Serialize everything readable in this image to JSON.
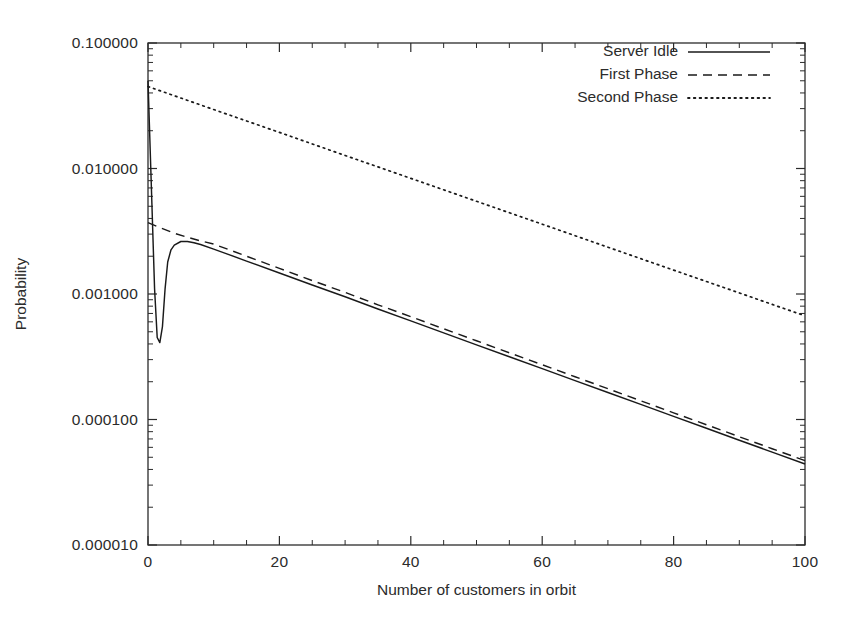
{
  "chart_data": {
    "type": "line",
    "title": "",
    "xlabel": "Number of customers in orbit",
    "ylabel": "Probability",
    "xlim": [
      0,
      100
    ],
    "ylim": [
      1e-05,
      0.1
    ],
    "yscale": "log",
    "xscale": "linear",
    "grid": false,
    "legend_position": "top-right inside plot",
    "xticks": [
      0,
      20,
      40,
      60,
      80,
      100
    ],
    "xtick_labels": [
      "0",
      "20",
      "40",
      "60",
      "80",
      "100"
    ],
    "yticks": [
      1e-05,
      0.0001,
      0.001,
      0.01,
      0.1
    ],
    "ytick_labels": [
      "0.000010",
      "0.000100",
      "0.001000",
      "0.010000",
      "0.100000"
    ],
    "minor_ticks": true,
    "series": [
      {
        "name": "Server Idle",
        "style": "solid",
        "color": "#1a1a1a",
        "x": [
          0,
          0.5,
          1,
          1.4,
          1.8,
          2.2,
          2.6,
          3,
          3.5,
          4,
          5,
          6,
          7,
          8,
          10,
          12,
          15,
          20,
          25,
          30,
          35,
          40,
          45,
          50,
          55,
          60,
          65,
          70,
          75,
          80,
          85,
          90,
          95,
          100
        ],
        "values": [
          0.05,
          0.0075,
          0.0011,
          0.00045,
          0.00041,
          0.00055,
          0.0011,
          0.0018,
          0.00225,
          0.00245,
          0.00262,
          0.00262,
          0.00256,
          0.00248,
          0.00228,
          0.00209,
          0.00183,
          0.00147,
          0.00118,
          0.00095,
          0.00076,
          0.00061,
          0.00049,
          0.000393,
          0.000316,
          0.000254,
          0.000204,
          0.000164,
          0.000132,
          0.000106,
          8.51e-05,
          6.84e-05,
          5.5e-05,
          4.42e-05
        ]
      },
      {
        "name": "First Phase",
        "style": "dashed",
        "color": "#1a1a1a",
        "x": [
          0,
          2,
          4,
          6,
          8,
          10,
          15,
          20,
          25,
          30,
          35,
          40,
          45,
          50,
          55,
          60,
          65,
          70,
          75,
          80,
          85,
          90,
          95,
          100
        ],
        "values": [
          0.0037,
          0.00335,
          0.00305,
          0.00283,
          0.00265,
          0.0025,
          0.002,
          0.0016,
          0.00128,
          0.00103,
          0.00082,
          0.00066,
          0.000528,
          0.000424,
          0.00034,
          0.000273,
          0.000219,
          0.000176,
          0.000141,
          0.000113,
          9.08e-05,
          7.29e-05,
          5.85e-05,
          4.7e-05
        ]
      },
      {
        "name": "Second Phase",
        "style": "dotted",
        "color": "#1a1a1a",
        "x": [
          0,
          10,
          20,
          30,
          40,
          50,
          60,
          70,
          80,
          90,
          100
        ],
        "values": [
          0.045,
          0.0295,
          0.0194,
          0.0127,
          0.00835,
          0.00548,
          0.0036,
          0.00236,
          0.00155,
          0.00102,
          0.00067
        ]
      }
    ]
  },
  "legend": {
    "items": [
      {
        "label": "Server Idle",
        "style": "solid"
      },
      {
        "label": "First Phase",
        "style": "dashed"
      },
      {
        "label": "Second Phase",
        "style": "dotted"
      }
    ]
  },
  "axes": {
    "x_title": "Number of customers in orbit",
    "y_title": "Probability",
    "x_tick_labels": [
      "0",
      "20",
      "40",
      "60",
      "80",
      "100"
    ],
    "y_tick_labels": [
      "0.000010",
      "0.000100",
      "0.001000",
      "0.010000",
      "0.100000"
    ]
  }
}
